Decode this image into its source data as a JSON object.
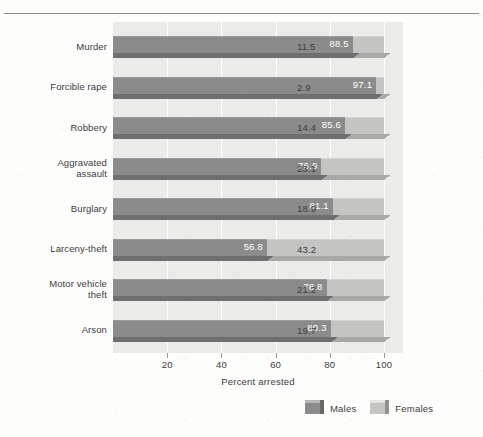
{
  "chart_data": {
    "type": "bar",
    "orientation": "horizontal",
    "stacked": true,
    "title": "",
    "xlabel": "Percent arrested",
    "ylabel": "",
    "xlim": [
      0,
      107
    ],
    "xticks": [
      20,
      40,
      60,
      80,
      100
    ],
    "xtick_labels": [
      "20",
      "40",
      "60",
      "80",
      "100"
    ],
    "grid": true,
    "legend_position": "bottom-right",
    "categories": [
      "Murder",
      "Forcible rape",
      "Robbery",
      "Aggravated\nassault",
      "Burglary",
      "Larceny-theft",
      "Motor vehicle\ntheft",
      "Arson"
    ],
    "series": [
      {
        "name": "Males",
        "color": "#8b8b8b",
        "values": [
          88.5,
          97.1,
          85.6,
          76.9,
          81.1,
          56.8,
          78.8,
          80.3
        ],
        "labels": [
          "88.5",
          "97.1",
          "85.6",
          "76.9",
          "81.1",
          "56.8",
          "78.8",
          "80.3"
        ]
      },
      {
        "name": "Females",
        "color": "#c4c4c2",
        "values": [
          11.5,
          2.9,
          14.4,
          23.1,
          18.9,
          43.2,
          21.2,
          19.7
        ],
        "labels": [
          "11.5",
          "2.9",
          "14.4",
          "23.1",
          "18.9",
          "43.2",
          "21.2",
          "19.7"
        ]
      }
    ]
  },
  "legend": {
    "items": [
      {
        "label": "Males",
        "color": "#8b8b8b"
      },
      {
        "label": "Females",
        "color": "#c4c4c2"
      }
    ]
  },
  "axis": {
    "x_title": "Percent arrested"
  },
  "colors": {
    "male_bar": "#8b8b8b",
    "male_bar_base": "#6f6f6f",
    "female_bar": "#c4c4c2",
    "female_bar_base": "#a9a9a7",
    "plot_background": "#ebebe9",
    "page_background": "#fdfdfc",
    "gridline": "#ffffff",
    "text": "#3c3c3c",
    "value_label_on_bar": "#ffffff",
    "top_rule": "#8d8d8d"
  }
}
